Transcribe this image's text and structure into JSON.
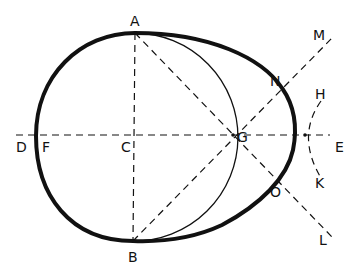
{
  "diagram": {
    "type": "geometric-construction",
    "colors": {
      "stroke": "#111111",
      "background": "#ffffff"
    },
    "points": {
      "A": {
        "label": "A",
        "x": 135,
        "y": 33
      },
      "B": {
        "label": "B",
        "x": 133,
        "y": 241
      },
      "C": {
        "label": "C",
        "x": 135,
        "y": 136
      },
      "D": {
        "label": "D",
        "x": 14,
        "y": 136
      },
      "E": {
        "label": "E",
        "x": 340,
        "y": 136
      },
      "F": {
        "label": "F",
        "x": 37,
        "y": 136
      },
      "G": {
        "label": "G",
        "x": 233,
        "y": 136
      },
      "H": {
        "label": "H",
        "x": 321,
        "y": 93
      },
      "K": {
        "label": "K",
        "x": 321,
        "y": 182
      },
      "L": {
        "label": "L",
        "x": 330,
        "y": 238
      },
      "M": {
        "label": "M",
        "x": 333,
        "y": 35
      },
      "N": {
        "label": "N",
        "x": 273,
        "y": 78
      },
      "O": {
        "label": "O",
        "x": 275,
        "y": 190
      }
    },
    "labels": {
      "A": "A",
      "B": "B",
      "C": "C",
      "D": "D",
      "E": "E",
      "F": "F",
      "G": "G",
      "H": "H",
      "K": "K",
      "L": "L",
      "M": "M",
      "N": "N",
      "O": "O"
    }
  }
}
